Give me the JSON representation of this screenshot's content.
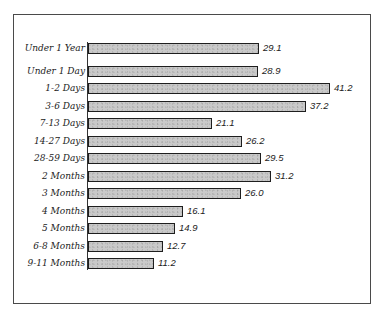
{
  "chart_data": {
    "type": "bar",
    "orientation": "horizontal",
    "title": "",
    "xlabel": "",
    "ylabel": "",
    "categories": [
      "Under 1 Year",
      "Under 1 Day",
      "1-2 Days",
      "3-6 Days",
      "7-13 Days",
      "14-27 Days",
      "28-59 Days",
      "2 Months",
      "3 Months",
      "4 Months",
      "5 Months",
      "6-8 Months",
      "9-11 Months"
    ],
    "values": [
      29.1,
      28.9,
      41.2,
      37.2,
      21.1,
      26.2,
      29.5,
      31.2,
      26.0,
      16.1,
      14.9,
      12.7,
      11.2
    ],
    "value_labels": [
      "29.1",
      "28.9",
      "41.2",
      "37.2",
      "21.1",
      "26.2",
      "29.5",
      "31.2",
      "26.0",
      "16.1",
      "14.9",
      "12.7",
      "11.2"
    ],
    "grid": false,
    "legend": null,
    "bar_color": "#c9c9c9",
    "bar_border_color": "#1e1e1e"
  }
}
